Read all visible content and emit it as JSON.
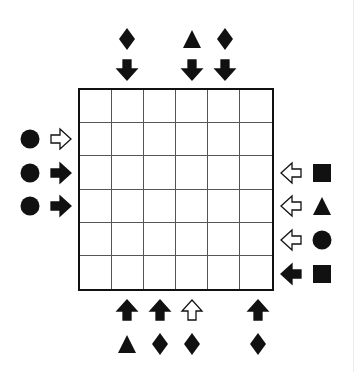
{
  "puzzle": {
    "rows": 6,
    "cols": 6,
    "cells": [
      [
        "",
        "",
        "",
        "",
        "",
        ""
      ],
      [
        "",
        "",
        "",
        "",
        "",
        ""
      ],
      [
        "",
        "",
        "",
        "",
        "",
        ""
      ],
      [
        "",
        "",
        "",
        "",
        "",
        ""
      ],
      [
        "",
        "",
        "",
        "",
        "",
        ""
      ],
      [
        "",
        "",
        "",
        "",
        "",
        ""
      ]
    ]
  },
  "clues": {
    "top": [
      {
        "col": 1,
        "arrow": "down",
        "arrow_style": "filled",
        "shape": "diamond"
      },
      {
        "col": 3,
        "arrow": "down",
        "arrow_style": "filled",
        "shape": "triangle"
      },
      {
        "col": 4,
        "arrow": "down",
        "arrow_style": "filled",
        "shape": "diamond"
      }
    ],
    "bottom": [
      {
        "col": 1,
        "arrow": "up",
        "arrow_style": "filled",
        "shape": "triangle"
      },
      {
        "col": 2,
        "arrow": "up",
        "arrow_style": "filled",
        "shape": "diamond"
      },
      {
        "col": 3,
        "arrow": "up",
        "arrow_style": "hollow",
        "shape": "diamond"
      },
      {
        "col": 5,
        "arrow": "up",
        "arrow_style": "filled",
        "shape": "diamond"
      }
    ],
    "left": [
      {
        "row": 1,
        "arrow": "right",
        "arrow_style": "hollow",
        "shape": "circle"
      },
      {
        "row": 2,
        "arrow": "right",
        "arrow_style": "filled",
        "shape": "circle"
      },
      {
        "row": 3,
        "arrow": "right",
        "arrow_style": "filled",
        "shape": "circle"
      }
    ],
    "right": [
      {
        "row": 2,
        "arrow": "left",
        "arrow_style": "hollow",
        "shape": "square"
      },
      {
        "row": 3,
        "arrow": "left",
        "arrow_style": "hollow",
        "shape": "triangle"
      },
      {
        "row": 4,
        "arrow": "left",
        "arrow_style": "hollow",
        "shape": "circle"
      },
      {
        "row": 5,
        "arrow": "left",
        "arrow_style": "filled",
        "shape": "square"
      }
    ]
  },
  "colors": {
    "ink": "#111111",
    "grid_line": "#555555",
    "background": "#ffffff"
  }
}
